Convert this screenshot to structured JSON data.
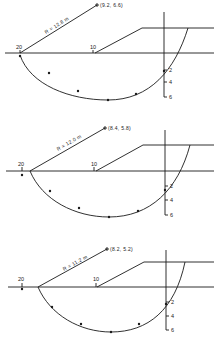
{
  "figure": {
    "colors": {
      "ink": "#1a1a1a",
      "background": "#ffffff"
    },
    "panels": [
      {
        "center_label": "(9.2, 6.6)",
        "radius_label": "R = 12.8 m",
        "x_ticks": {
          "left": "20",
          "mid": "10"
        },
        "depth_ticks": [
          "2",
          "4",
          "6"
        ]
      },
      {
        "center_label": "(8.4, 5.8)",
        "radius_label": "R = 12.0 m",
        "x_ticks": {
          "left": "20",
          "mid": "10"
        },
        "depth_ticks": [
          "2",
          "4",
          "6"
        ]
      },
      {
        "center_label": "(8.2, 5.2)",
        "radius_label": "R = 11.2 m",
        "x_ticks": {
          "left": "20",
          "mid": "10"
        },
        "depth_ticks": [
          "2",
          "4",
          "6"
        ]
      }
    ]
  }
}
